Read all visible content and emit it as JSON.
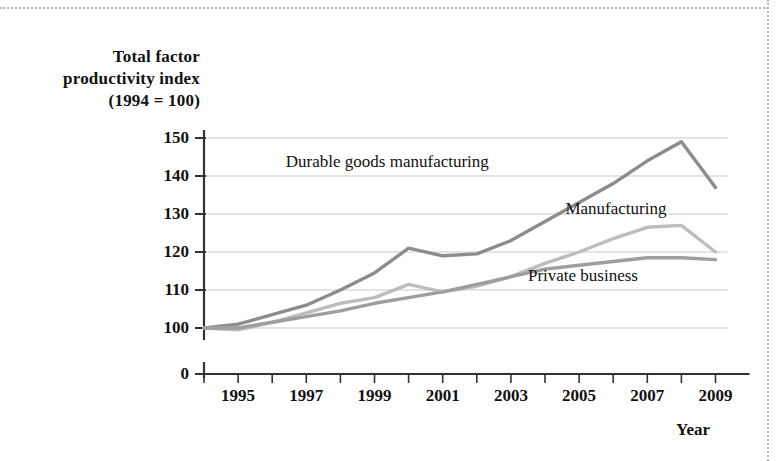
{
  "chart_data": {
    "type": "line",
    "title": "",
    "ylabel": "Total factor productivity index (1994 = 100)",
    "ylabel_lines": [
      "Total factor",
      "productivity index",
      "(1994 = 100)"
    ],
    "xlabel": "Year",
    "x": [
      1994,
      1995,
      1996,
      1997,
      1998,
      1999,
      2000,
      2001,
      2002,
      2003,
      2004,
      2005,
      2006,
      2007,
      2008,
      2009
    ],
    "xtick_labels": [
      "1995",
      "1997",
      "1999",
      "2001",
      "2003",
      "2005",
      "2007",
      "2009"
    ],
    "xtick_years": [
      1995,
      1997,
      1999,
      2001,
      2003,
      2005,
      2007,
      2009
    ],
    "ytick_labels": [
      "0",
      "100",
      "110",
      "120",
      "130",
      "140",
      "150"
    ],
    "ytick_values": [
      0,
      100,
      110,
      120,
      130,
      140,
      150
    ],
    "ylim": [
      100,
      150
    ],
    "axis_break": true,
    "grid": true,
    "grid_axis": "y",
    "legend": "inline-labels",
    "series": [
      {
        "name": "Durable goods manufacturing",
        "color": "#8c8c8c",
        "label_x": 1996.4,
        "label_y": 143.5,
        "values": [
          100,
          101,
          103.5,
          106,
          110,
          114.5,
          121,
          119,
          119.5,
          123,
          128,
          133,
          138,
          144,
          149,
          137
        ]
      },
      {
        "name": "Manufacturing",
        "color": "#bdbdbd",
        "label_x": 2004.6,
        "label_y": 131,
        "values": [
          100,
          99.5,
          101.5,
          104,
          106.5,
          108,
          111.5,
          109.5,
          111,
          113.5,
          117,
          120,
          123.5,
          126.5,
          127,
          120
        ]
      },
      {
        "name": "Private business",
        "color": "#9e9e9e",
        "label_x": 2003.5,
        "label_y": 113.5,
        "values": [
          100,
          100,
          101.5,
          103,
          104.5,
          106.5,
          108,
          109.5,
          111.5,
          113.5,
          115.5,
          116.5,
          117.5,
          118.5,
          118.5,
          118
        ]
      }
    ]
  }
}
